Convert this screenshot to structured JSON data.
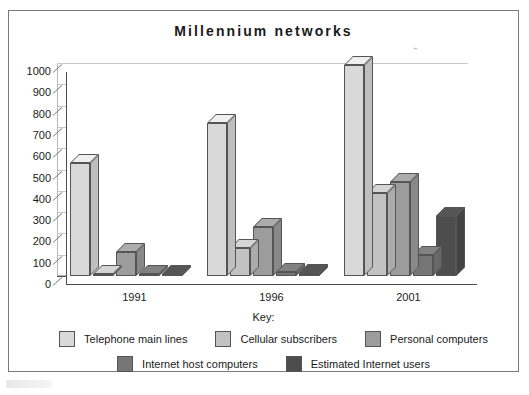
{
  "figure": {
    "title": "Millennium networks",
    "key_label": "Key:"
  },
  "chart_data": {
    "type": "bar",
    "title": "Millennium networks",
    "subtitle": "",
    "xlabel": "",
    "ylabel": "",
    "categories": [
      "1991",
      "1996",
      "2001"
    ],
    "ylim": [
      0,
      1000
    ],
    "yticks": [
      0,
      100,
      200,
      300,
      400,
      500,
      600,
      700,
      800,
      900,
      1000
    ],
    "ytick_labels": [
      "0",
      "100",
      "200",
      "300",
      "400",
      "500",
      "600",
      "700",
      "800",
      "900",
      "1000"
    ],
    "grid": true,
    "legend_position": "bottom",
    "style": "3d-column",
    "series": [
      {
        "name": "Telephone main lines",
        "color": "#d9d9d9",
        "values": [
          530,
          720,
          990
        ]
      },
      {
        "name": "Cellular subscribers",
        "color": "#c2c2c2",
        "values": [
          10,
          130,
          390
        ]
      },
      {
        "name": "Personal computers",
        "color": "#9c9c9c",
        "values": [
          115,
          230,
          440
        ]
      },
      {
        "name": "Internet host computers",
        "color": "#767676",
        "values": [
          5,
          20,
          100
        ]
      },
      {
        "name": "Estimated Internet users",
        "color": "#4d4d4d",
        "values": [
          3,
          12,
          280
        ]
      }
    ]
  },
  "legend": {
    "rows": [
      [
        {
          "label": "Telephone main lines",
          "color": "#d9d9d9"
        },
        {
          "label": "Cellular subscribers",
          "color": "#c2c2c2"
        },
        {
          "label": "Personal computers",
          "color": "#9c9c9c"
        }
      ],
      [
        {
          "label": "Internet host computers",
          "color": "#767676"
        },
        {
          "label": "Estimated Internet users",
          "color": "#4d4d4d"
        }
      ]
    ]
  }
}
